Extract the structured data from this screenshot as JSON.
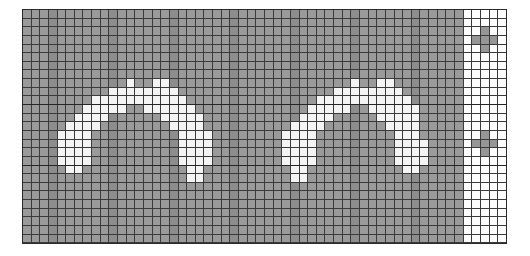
{
  "figure": {
    "name": "pixel-grid-visualization",
    "background_color": "#ffffff"
  },
  "grid": {
    "columns": 56,
    "rows": 27,
    "cell_size_px": 8.65,
    "origin_x_px": 22,
    "origin_y_px": 9,
    "line_color": "#3a3a3a",
    "line_width_px": 1,
    "palette": {
      "gray": "#9a9a9a",
      "gray_dark": "#8d8d8d",
      "white": "#f4f4f4",
      "white_panel": "#fdfdfd",
      "plus_gray": "#969696",
      "border": "#2b2b2b"
    },
    "panel_split_column": 51,
    "major_rule_rows": [
      11,
      18
    ],
    "legend": {
      "0": "gray field",
      "1": "white glyph pixel",
      "2": "white panel",
      "3": "gray plus mark"
    },
    "cells": [
      "000000000000000000000000000000000000000000000000000222222",
      "000000000000000000000000000000000000000000000000000222222",
      "000000000000000000000000000000000000000000000000000223222",
      "000000000000000000000000000000000000000000000000000233322",
      "000000000000000000000000000000000000000000000000000223222",
      "000000000000000000000000000000000000000000000000000222222",
      "000000000000000000000000000000000000000000000000000222222",
      "000000000000000000000000000000000000000000000000000222222",
      "000000000000100110000000000000000000001001100000000222222",
      "000000000011111111000000000000000000111111110000000222222",
      "000000001111111111100000000000000011111111111000000222222",
      "000000011111001111110000000000000111110011111100000222222",
      "000000111100000011111000000000001111000001111100000222222",
      "000001111000000001111000000000011110000000111100000222222",
      "000011110000000000111100000000111100000000011100000223222",
      "000011110000000000111100000000111100000000011110000233322",
      "000011110000000000111100000000111100000000011110000223222",
      "000011110000000000111100000000111100000000011110000222222",
      "000001100000000000011000000000011000000000001100000222222",
      "000000000000000000011000000000011000000000000000000222222",
      "000000000000000000000000000000000000000000000000000222222",
      "000000000000000000000000000000000000000000000000000222222",
      "000000000000000000000000000000000000000000000000000222222",
      "000000000000000000000000000000000000000000000000000222222",
      "000000000000000000000000000000000000000000000000000222222",
      "000000000000000000000000000000000000000000000000000222222",
      "000000000000000000000000000000000000000000000000000222222"
    ]
  }
}
